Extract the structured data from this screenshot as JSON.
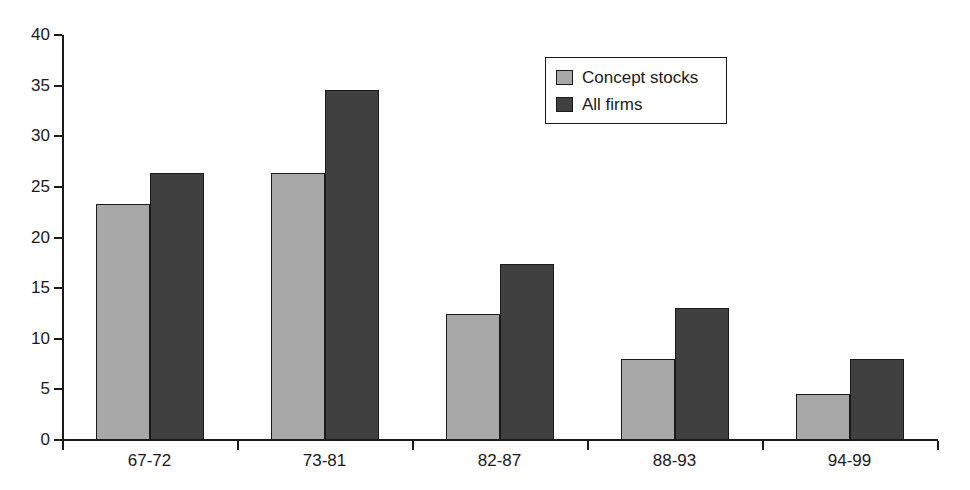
{
  "chart_data": {
    "type": "bar",
    "title": "",
    "subtitle": "",
    "xlabel": "",
    "ylabel": "",
    "categories": [
      "67-72",
      "73-81",
      "82-87",
      "88-93",
      "94-99"
    ],
    "series": [
      {
        "name": "Concept stocks",
        "color": "#a8a8a8",
        "values": [
          23.3,
          26.4,
          12.4,
          8.0,
          4.5
        ]
      },
      {
        "name": "All firms",
        "color": "#404040",
        "values": [
          26.4,
          34.6,
          17.4,
          13.0,
          8.0
        ]
      }
    ],
    "ylim": [
      0,
      40
    ],
    "yticks": [
      0,
      5,
      10,
      15,
      20,
      25,
      30,
      35,
      40
    ],
    "ytick_labels": [
      "0",
      "5",
      "10",
      "15",
      "20",
      "25",
      "30",
      "35",
      "40"
    ],
    "grid": false,
    "legend_position": "top-center",
    "annotations": []
  },
  "legend": {
    "entries": [
      {
        "label": "Concept stocks"
      },
      {
        "label": "All firms"
      }
    ]
  },
  "colors": {
    "series_light": "#a8a8a8",
    "series_dark": "#404040",
    "axis": "#1a1a1a",
    "background": "#ffffff"
  }
}
